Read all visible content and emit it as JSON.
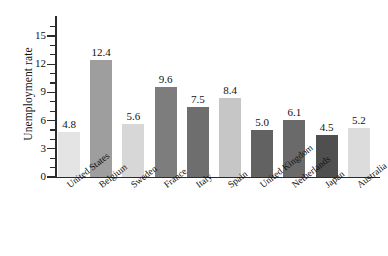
{
  "chart_data": {
    "type": "bar",
    "title": "",
    "xlabel": "",
    "ylabel": "Unemployment rate",
    "ylim": [
      0,
      16.5
    ],
    "ytick_labels": [
      "0",
      "3",
      "6",
      "9",
      "12",
      "15"
    ],
    "ytick_values": [
      0,
      3,
      6,
      9,
      12,
      15
    ],
    "minor_ticks": true,
    "grid": false,
    "legend": null,
    "categories": [
      "United States",
      "Belgium",
      "Sweden",
      "France",
      "Italy",
      "Spain",
      "United Kingdom",
      "Netherlands",
      "Japan",
      "Australia"
    ],
    "values": [
      4.8,
      12.4,
      5.6,
      9.6,
      7.5,
      8.4,
      5.0,
      6.1,
      4.5,
      5.2
    ],
    "value_labels": [
      "4.8",
      "12.4",
      "5.6",
      "9.6",
      "7.5",
      "8.4",
      "5.0",
      "6.1",
      "4.5",
      "5.2"
    ],
    "bar_colors": [
      "#e4e4e4",
      "#9e9e9e",
      "#d7d7d7",
      "#7d7d7d",
      "#6e6e6e",
      "#c6c6c6",
      "#626262",
      "#6a6a6a",
      "#4f4f4f",
      "#dcdcdc"
    ],
    "axis_color": "#2b2b2b",
    "background_color": "#ffffff"
  }
}
